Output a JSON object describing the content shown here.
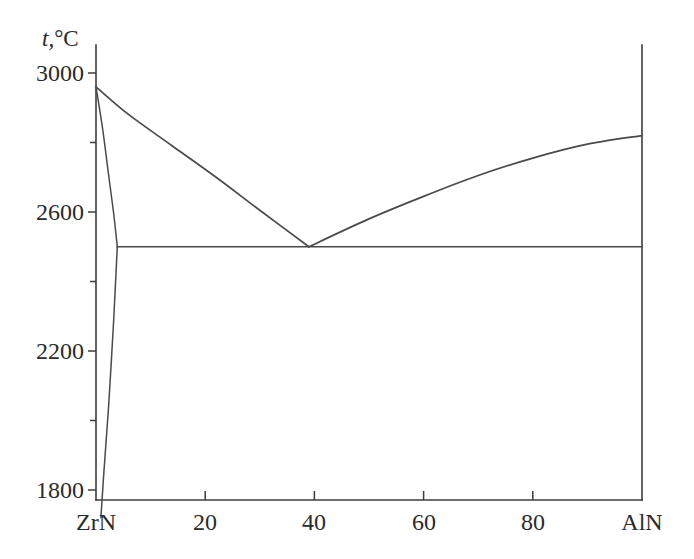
{
  "chart_data": {
    "type": "line",
    "title": "",
    "subtitle": "",
    "xlabel": "",
    "ylabel": "t, °C",
    "ylabel_symbol": "t,",
    "ylabel_unit": "°C",
    "xlim": [
      0,
      100
    ],
    "ylim": [
      1700,
      3050
    ],
    "grid": false,
    "legend": null,
    "x_endpoint_labels": {
      "left": "ZrN",
      "right": "AlN"
    },
    "xticks": [
      {
        "value": 0,
        "label": "ZrN"
      },
      {
        "value": 20,
        "label": "20"
      },
      {
        "value": 40,
        "label": "40"
      },
      {
        "value": 60,
        "label": "60"
      },
      {
        "value": 80,
        "label": "80"
      },
      {
        "value": 100,
        "label": "AlN"
      }
    ],
    "yticks_major": [
      {
        "value": 3000,
        "label": "3000"
      },
      {
        "value": 2600,
        "label": "2600"
      },
      {
        "value": 2200,
        "label": "2200"
      },
      {
        "value": 1800,
        "label": "1800"
      }
    ],
    "yticks_minor": [
      2800,
      2400,
      2000
    ],
    "annotations": [
      {
        "name": "eutectic-point",
        "x": 39,
        "y": 2500
      },
      {
        "name": "zrn-melting-point",
        "x": 0,
        "y": 2960
      },
      {
        "name": "aln-melting-point",
        "x": 100,
        "y": 2820
      }
    ],
    "series": [
      {
        "name": "liquidus-zrn-branch",
        "points": [
          [
            0,
            2960
          ],
          [
            6,
            2880
          ],
          [
            14,
            2790
          ],
          [
            22,
            2700
          ],
          [
            30,
            2605
          ],
          [
            39,
            2500
          ]
        ]
      },
      {
        "name": "liquidus-aln-branch",
        "points": [
          [
            39,
            2500
          ],
          [
            50,
            2580
          ],
          [
            60,
            2645
          ],
          [
            70,
            2705
          ],
          [
            80,
            2755
          ],
          [
            90,
            2795
          ],
          [
            100,
            2820
          ]
        ]
      },
      {
        "name": "eutectic-horizontal",
        "points": [
          [
            3.9,
            2500
          ],
          [
            39,
            2500
          ],
          [
            100,
            2500
          ]
        ]
      },
      {
        "name": "solidus-zrn-side",
        "points": [
          [
            0,
            2960
          ],
          [
            1.2,
            2840
          ],
          [
            2.2,
            2720
          ],
          [
            3.2,
            2600
          ],
          [
            3.9,
            2500
          ]
        ]
      },
      {
        "name": "solvus-zrn-side",
        "points": [
          [
            3.9,
            2500
          ],
          [
            3.2,
            2280
          ],
          [
            2.3,
            2040
          ],
          [
            1.4,
            1840
          ],
          [
            0.9,
            1720
          ]
        ]
      }
    ]
  },
  "geometry": {
    "plot_left_px": 96,
    "plot_right_px": 642,
    "plot_bottom_px": 500,
    "plot_top_px": 45,
    "y3000_px": 73,
    "y1800_px": 490
  }
}
